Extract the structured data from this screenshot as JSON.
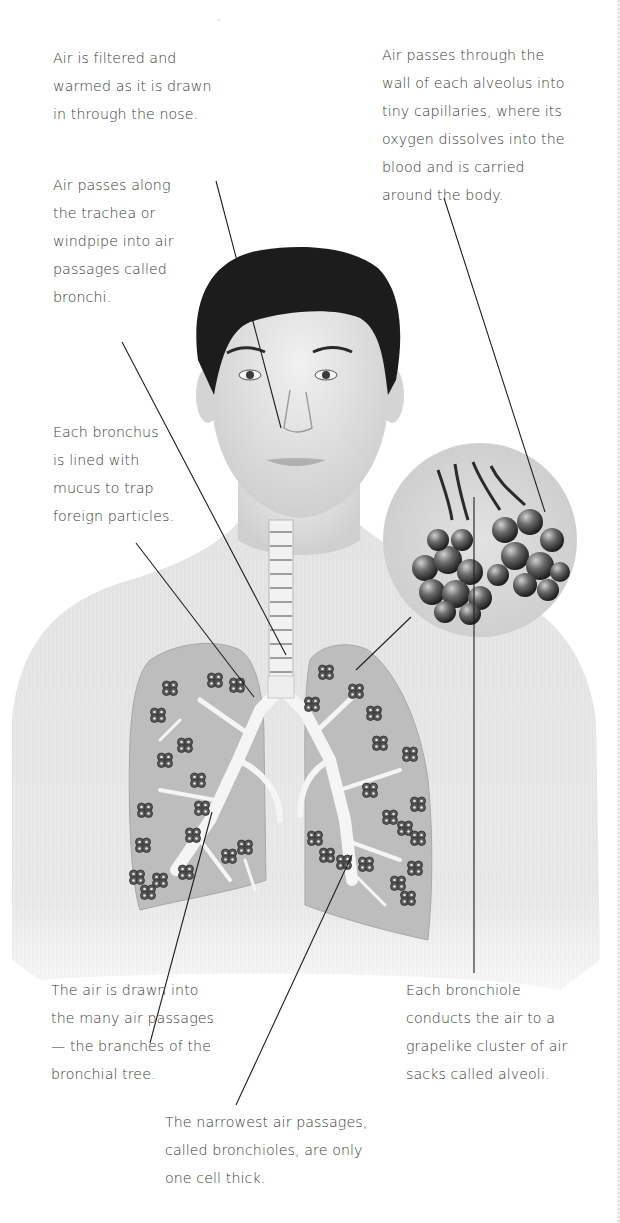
{
  "diagram": {
    "colors": {
      "background": "#ffffff",
      "text": "#3b3b3b",
      "leader_line": "#1e1e1e",
      "skin": "#e6e6e6",
      "hair": "#1c1c1c",
      "lung_fill": "#bdbdbd",
      "airway": "#f4f4f4",
      "alveoli_cluster": "#4a4a4a"
    },
    "labels": {
      "nose": {
        "lines": [
          "Air is filtered and",
          "warmed as it is drawn",
          "in through the nose."
        ]
      },
      "trachea": {
        "lines": [
          "Air passes along",
          "the trachea or",
          "windpipe into air",
          "passages called",
          "bronchi."
        ]
      },
      "bronchus": {
        "lines": [
          "Each bronchus",
          "is lined with",
          "mucus to trap",
          "foreign particles."
        ]
      },
      "alveolus_wall": {
        "lines": [
          "Air passes through the",
          "wall of each alveolus into",
          "tiny capillaries, where its",
          "oxygen dissolves into the",
          "blood and is carried",
          "around the body."
        ]
      },
      "bronchial_tree": {
        "lines": [
          "The air is drawn into",
          "the many air passages",
          "— the branches of the",
          "bronchial tree."
        ]
      },
      "bronchiole": {
        "lines": [
          "Each bronchiole",
          "conducts the air to a",
          "grapelike cluster of air",
          "sacks called alveoli."
        ]
      },
      "bronchioles_narrow": {
        "lines": [
          "The narrowest air passages,",
          "called bronchioles, are only",
          "one cell thick."
        ]
      }
    },
    "illustration_parts": [
      "head",
      "neck",
      "torso",
      "trachea",
      "bronchi",
      "left-lung",
      "right-lung",
      "alveoli-inset-circle"
    ]
  }
}
